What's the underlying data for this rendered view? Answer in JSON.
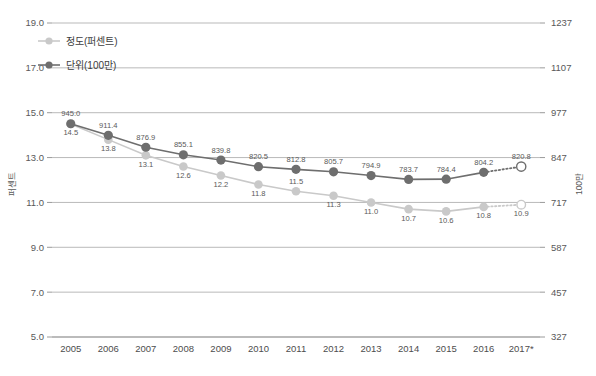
{
  "chart_data": {
    "type": "line",
    "title": "",
    "subtitle": "",
    "xlabel": "",
    "ylabel": "퍼센트",
    "ylabel_right": "100만",
    "grid": true,
    "legend_position": "top-left",
    "categories": [
      "2005",
      "2006",
      "2007",
      "2008",
      "2009",
      "2010",
      "2011",
      "2012",
      "2013",
      "2014",
      "2015",
      "2016",
      "2017*"
    ],
    "ylim": [
      5.0,
      19.0
    ],
    "yticks": [
      "19.0",
      "17.0",
      "15.0",
      "13.0",
      "11.0",
      "9.0",
      "7.0",
      "5.0"
    ],
    "ytick_values": [
      19.0,
      17.0,
      15.0,
      13.0,
      11.0,
      9.0,
      7.0,
      5.0
    ],
    "ylim_right": [
      327,
      1237
    ],
    "yticks_right": [
      "1237",
      "1107",
      "977",
      "847",
      "717",
      "587",
      "457",
      "327"
    ],
    "ytick_values_right": [
      1237,
      1107,
      977,
      847,
      717,
      587,
      457,
      327
    ],
    "series": [
      {
        "name": "정도(퍼센트)",
        "axis": "left",
        "color": "#c9c9c9",
        "label_color": "#6b6b6b",
        "values": [
          14.5,
          13.8,
          13.1,
          12.6,
          12.2,
          11.8,
          11.5,
          11.3,
          11.0,
          10.7,
          10.6,
          10.8,
          10.9
        ],
        "labels": [
          "14.5",
          "13.8",
          "13.1",
          "12.6",
          "12.2",
          "11.8",
          "11.5",
          "11.3",
          "11.0",
          "10.7",
          "10.6",
          "10.8",
          "10.9"
        ],
        "label_pos": [
          "below",
          "below",
          "below",
          "below",
          "below",
          "below",
          "above",
          "below",
          "below",
          "below",
          "below",
          "below",
          "below"
        ],
        "projected_last": true
      },
      {
        "name": "단위(100만)",
        "axis": "right",
        "color": "#6e6e6e",
        "label_color": "#5a5a5a",
        "values": [
          945.0,
          911.4,
          876.9,
          855.1,
          839.8,
          820.5,
          812.8,
          805.7,
          794.9,
          783.7,
          784.4,
          804.2,
          820.8
        ],
        "labels": [
          "945.0",
          "911.4",
          "876.9",
          "855.1",
          "839.8",
          "820.5",
          "812.8",
          "805.7",
          "794.9",
          "783.7",
          "784.4",
          "804.2",
          "820.8"
        ],
        "label_pos": [
          "above",
          "above",
          "above",
          "above",
          "above",
          "above",
          "above",
          "above",
          "above",
          "above",
          "above",
          "above",
          "above"
        ],
        "projected_last": true
      }
    ],
    "annotations": [
      {
        "text": "2017* 는 예측치",
        "visible": false
      }
    ]
  },
  "legend": {
    "items": [
      {
        "label": "정도(퍼센트)",
        "color": "#c9c9c9"
      },
      {
        "label": "단위(100만)",
        "color": "#6e6e6e"
      }
    ]
  },
  "axes": {
    "left_title": "퍼센트",
    "right_title": "100만"
  }
}
